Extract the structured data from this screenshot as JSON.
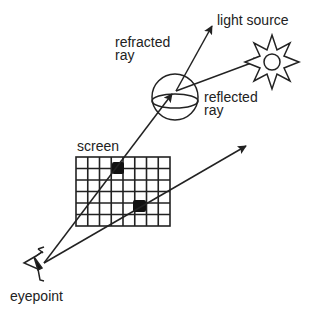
{
  "labels": {
    "light_source": "light source",
    "refracted_ray_line1": "refracted",
    "refracted_ray_line2": "ray",
    "reflected_ray_line1": "reflected",
    "reflected_ray_line2": "ray",
    "screen": "screen",
    "eyepoint": "eyepoint"
  },
  "colors": {
    "ink": "#222222",
    "background": "#ffffff"
  },
  "icons": {
    "eye": "eye-icon",
    "sun": "sun-icon",
    "sphere": "sphere-object"
  },
  "grid": {
    "columns": 8,
    "rows": 6
  }
}
